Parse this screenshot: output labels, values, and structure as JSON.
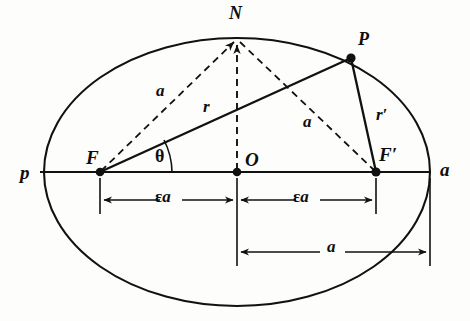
{
  "figure": {
    "type": "geometric-diagram",
    "colors": {
      "stroke": "#111111",
      "background": "#fdfdfb",
      "text": "#0d0d0d"
    },
    "canvas": {
      "width": 470,
      "height": 321
    }
  },
  "ellipse": {
    "center": {
      "x": 237,
      "y": 172
    },
    "semi_major_a": 193,
    "semi_minor_b": 134,
    "eccentricity_marker": "ε"
  },
  "points": [
    {
      "key": "p",
      "label": "p",
      "x": 40,
      "y": 172,
      "label_x": 20,
      "label_y": 163,
      "dot": false
    },
    {
      "key": "F",
      "label": "F",
      "x": 100,
      "y": 172,
      "label_x": 86,
      "label_y": 148,
      "dot": true
    },
    {
      "key": "O",
      "label": "O",
      "x": 237,
      "y": 172,
      "label_x": 245,
      "label_y": 150,
      "dot": true
    },
    {
      "key": "Fp",
      "label": "F′",
      "x": 376,
      "y": 172,
      "label_x": 379,
      "label_y": 145,
      "dot": true
    },
    {
      "key": "a",
      "label": "a",
      "x": 430,
      "y": 172,
      "label_x": 440,
      "label_y": 160,
      "dot": false
    },
    {
      "key": "N",
      "label": "N",
      "x": 237,
      "y": 38,
      "label_x": 229,
      "label_y": 4,
      "dot": false
    },
    {
      "key": "P",
      "label": "P",
      "x": 351,
      "y": 58,
      "label_x": 358,
      "label_y": 30,
      "dot": true
    }
  ],
  "segments": [
    {
      "key": "FP",
      "label": "r",
      "from": "F",
      "to": "P",
      "style": "solid",
      "label_x": 203,
      "label_y": 98
    },
    {
      "key": "PFp",
      "label": "r′",
      "from": "P",
      "to": "Fp",
      "style": "solid",
      "label_x": 376,
      "label_y": 106
    },
    {
      "key": "FN",
      "label": "a",
      "from": "F",
      "to": "N",
      "style": "dashed",
      "label_x": 156,
      "label_y": 82
    },
    {
      "key": "NFp",
      "label": "a",
      "from": "N",
      "to": "Fp",
      "style": "dashed",
      "label_x": 303,
      "label_y": 113
    },
    {
      "key": "ON",
      "label": "",
      "from": "O",
      "to": "N",
      "style": "dashed",
      "label_x": 0,
      "label_y": 0
    }
  ],
  "angle": {
    "key": "theta",
    "label": "θ",
    "vertex": "F",
    "label_x": 155,
    "label_y": 147
  },
  "dimensions": [
    {
      "key": "eps-a-left",
      "label_prefix": "ε",
      "label_suffix": "a",
      "label": "εa",
      "from_x": 100,
      "to_x": 237,
      "y": 200,
      "label_x": 155,
      "label_y": 188,
      "extension_from_y": 178,
      "extension_to_y": 214
    },
    {
      "key": "eps-a-right",
      "label_prefix": "ε",
      "label_suffix": "a",
      "label": "εa",
      "from_x": 237,
      "to_x": 376,
      "y": 200,
      "label_x": 293,
      "label_y": 188,
      "extension_from_y": 178,
      "extension_to_y": 214
    },
    {
      "key": "a-bottom",
      "label_prefix": "",
      "label_suffix": "a",
      "label": "a",
      "from_x": 237,
      "to_x": 430,
      "y": 252,
      "label_x": 327,
      "label_y": 238,
      "extension_from_y": 178,
      "extension_to_y": 266
    }
  ],
  "axis_line": {
    "from_x": 40,
    "to_x": 430,
    "y": 172
  }
}
